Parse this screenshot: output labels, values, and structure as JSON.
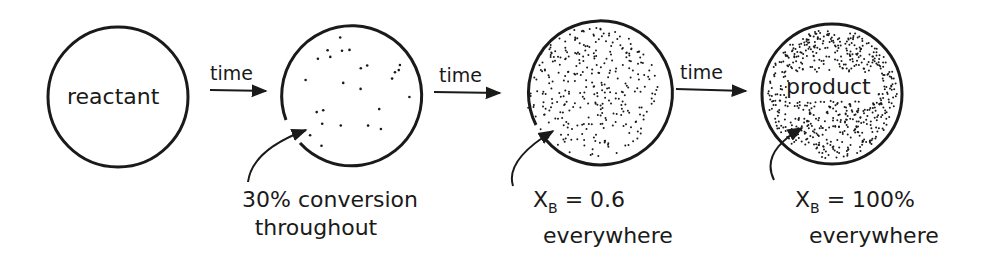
{
  "diagram": {
    "stages": [
      {
        "id": "stage-1",
        "inside_label": "reactant",
        "dot_density": 0,
        "note_line1": "",
        "note_line2": ""
      },
      {
        "id": "stage-2",
        "inside_label": "",
        "dot_density": 25,
        "note_line1": "30% conversion",
        "note_line2": "throughout"
      },
      {
        "id": "stage-3",
        "inside_label": "",
        "dot_density": 320,
        "note_line1_prefix": "X",
        "note_line1_sub": "B",
        "note_line1_suffix": " = 0.6",
        "note_line2": "everywhere"
      },
      {
        "id": "stage-4",
        "inside_label": "product",
        "dot_density": 700,
        "note_line1_prefix": "X",
        "note_line1_sub": "B",
        "note_line1_suffix": " = 100%",
        "note_line2": "everywhere"
      }
    ],
    "arrows": [
      {
        "label": "time"
      },
      {
        "label": "time"
      },
      {
        "label": "time"
      }
    ],
    "colors": {
      "ink": "#1a1a1a",
      "background": "#ffffff"
    }
  }
}
